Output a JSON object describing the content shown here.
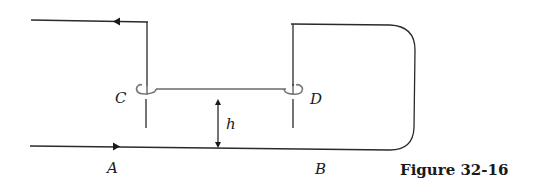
{
  "figure": {
    "caption": "Figure 32-16",
    "labels": {
      "A": "A",
      "B": "B",
      "C": "C",
      "D": "D",
      "h": "h"
    },
    "arrows": {
      "top_flow_direction": "left",
      "bottom_flow_direction": "right"
    },
    "colors": {
      "wire": "#2a2a2a",
      "connecting_tube": "#6a6a6a",
      "background": "#ffffff"
    }
  }
}
